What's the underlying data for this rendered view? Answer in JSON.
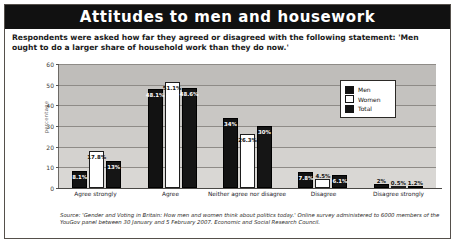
{
  "title": "Attitudes to men and housework",
  "intro": "Respondents were asked how far they agreed or disagreed with the following statement: 'Men ought to do a larger share of household work than they do now.'",
  "source": "Source: 'Gender and Voting in Britain: How men and women think about politics today.' Online survey administered to 6000 members of the YouGov panel between 30 January and 5 February 2007. Economic and Social Research Council.",
  "legend": {
    "items": [
      {
        "label": "Men",
        "color": "#121212"
      },
      {
        "label": "Women",
        "color": "#ffffff"
      },
      {
        "label": "Total",
        "color": "#151515"
      }
    ]
  },
  "chart_data": {
    "type": "bar",
    "title": "Attitudes to men and housework",
    "xlabel": "",
    "ylabel": "percentage",
    "ylim": [
      0,
      60
    ],
    "yticks": [
      0,
      10,
      20,
      30,
      40,
      50,
      60
    ],
    "ytick_labels": [
      "0",
      "10",
      "20",
      "30",
      "40",
      "50",
      "60"
    ],
    "grid": true,
    "legend_position": "upper-right-inset",
    "categories": [
      "Agree strongly",
      "Agree",
      "Neither agree nor disagree",
      "Disagree",
      "Disagree strongly"
    ],
    "series": [
      {
        "name": "Men",
        "color": "#121212",
        "values": [
          8.1,
          48.1,
          34.0,
          7.8,
          2.0
        ],
        "labels": [
          "8.1%",
          "48.1%",
          "34%",
          "7.8%",
          "2%"
        ]
      },
      {
        "name": "Women",
        "color": "#ffffff",
        "values": [
          17.8,
          51.1,
          26.3,
          4.5,
          0.5
        ],
        "labels": [
          "17.8%",
          "51.1%",
          "26.3%",
          "4.5%",
          "0.5%"
        ]
      },
      {
        "name": "Total",
        "color": "#151515",
        "values": [
          13.0,
          48.6,
          30.0,
          6.1,
          1.2
        ],
        "labels": [
          "13%",
          "48.6%",
          "30%",
          "6.1%",
          "1.2%"
        ]
      }
    ]
  }
}
